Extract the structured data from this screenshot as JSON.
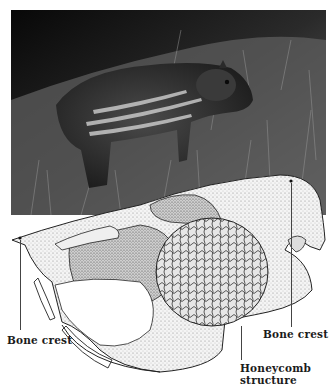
{
  "figure": {
    "photo": {
      "subject": "young paca in grass",
      "tone": "grayscale"
    },
    "illustration": {
      "subject": "paca skull stipple drawing",
      "labels": [
        {
          "id": "bone-crest-left",
          "text": "Bone crest"
        },
        {
          "id": "bone-crest-right",
          "text": "Bone crest"
        },
        {
          "id": "honeycomb",
          "text": "Honeycomb",
          "text2": "structure"
        }
      ]
    }
  },
  "colors": {
    "background": "#ffffff",
    "photo_dark": "#111111",
    "grass": "#6b6b6b",
    "ink": "#1c1c1c"
  }
}
